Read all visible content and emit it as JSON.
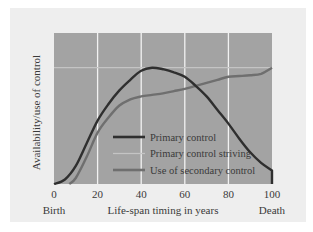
{
  "chart_data": {
    "type": "line",
    "title": "",
    "xlabel": "Life-span timing in years",
    "ylabel": "Availability/use of control",
    "xlim": [
      0,
      100
    ],
    "ylim": [
      0,
      100
    ],
    "x_ticks": [
      0,
      20,
      40,
      60,
      80,
      100
    ],
    "x_tick_labels": [
      "0",
      "20",
      "40",
      "60",
      "80",
      "100"
    ],
    "x_start_label": "Birth",
    "x_end_label": "Death",
    "grid": {
      "vertical": true,
      "horizontal": false
    },
    "legend_position": "bottom-center-inside",
    "series": [
      {
        "name": "Primary control",
        "color": "#2f2f2f",
        "points": [
          [
            0,
            0
          ],
          [
            5,
            3
          ],
          [
            10,
            12
          ],
          [
            15,
            27
          ],
          [
            20,
            42
          ],
          [
            25,
            53
          ],
          [
            30,
            62
          ],
          [
            35,
            69
          ],
          [
            40,
            75
          ],
          [
            45,
            77
          ],
          [
            50,
            76
          ],
          [
            55,
            74
          ],
          [
            60,
            71
          ],
          [
            65,
            65
          ],
          [
            70,
            58
          ],
          [
            75,
            49
          ],
          [
            80,
            40
          ],
          [
            85,
            30
          ],
          [
            90,
            21
          ],
          [
            95,
            14
          ],
          [
            100,
            9
          ],
          [
            100,
            0
          ]
        ]
      },
      {
        "name": "Primary control striving",
        "color": "#c4c4c4",
        "points": [
          [
            0,
            77
          ],
          [
            100,
            77
          ]
        ]
      },
      {
        "name": "Use of secondary control",
        "color": "#6f6f6f",
        "points": [
          [
            7,
            0
          ],
          [
            10,
            4
          ],
          [
            15,
            18
          ],
          [
            20,
            34
          ],
          [
            25,
            44
          ],
          [
            30,
            52
          ],
          [
            35,
            56
          ],
          [
            40,
            58
          ],
          [
            45,
            59
          ],
          [
            50,
            60
          ],
          [
            55,
            61.5
          ],
          [
            60,
            63
          ],
          [
            65,
            65
          ],
          [
            70,
            67
          ],
          [
            75,
            69
          ],
          [
            80,
            71
          ],
          [
            85,
            71.5
          ],
          [
            90,
            72
          ],
          [
            95,
            73
          ],
          [
            100,
            77
          ]
        ]
      }
    ],
    "colors": {
      "panel_background": "#eeeeee",
      "plot_background": "#a3a3a3",
      "grid": "#f2f2f2"
    }
  }
}
